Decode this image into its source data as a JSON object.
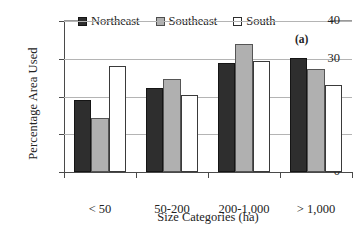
{
  "chart_data": {
    "type": "bar",
    "title": "",
    "annotation": "(a)",
    "xlabel": "Size Categories (ha)",
    "ylabel": "Percentage Area Used",
    "categories": [
      "< 50",
      "50-200",
      "200-1,000",
      "> 1,000"
    ],
    "series": [
      {
        "name": "Northeast",
        "color": "#2e2e2e",
        "values": [
          19.0,
          22.2,
          29.0,
          30.2
        ]
      },
      {
        "name": "Southeast",
        "color": "#b0b0b0",
        "values": [
          14.3,
          24.6,
          34.0,
          27.3
        ]
      },
      {
        "name": "South",
        "color": "#ffffff",
        "values": [
          28.0,
          20.4,
          29.4,
          23.0
        ]
      }
    ],
    "ylim": [
      0,
      40
    ],
    "yticks": [
      0,
      10,
      20,
      30,
      40
    ],
    "ytick_labels": [
      "0",
      "10",
      "20",
      "30",
      "40"
    ],
    "grid": true,
    "grid_axis": "y",
    "legend_position": "top"
  },
  "legend": {
    "items": [
      {
        "label": "Northeast",
        "swatch": "filled-dark-square-icon"
      },
      {
        "label": "Southeast",
        "swatch": "filled-gray-square-icon"
      },
      {
        "label": "South",
        "swatch": "open-white-square-icon"
      }
    ]
  }
}
